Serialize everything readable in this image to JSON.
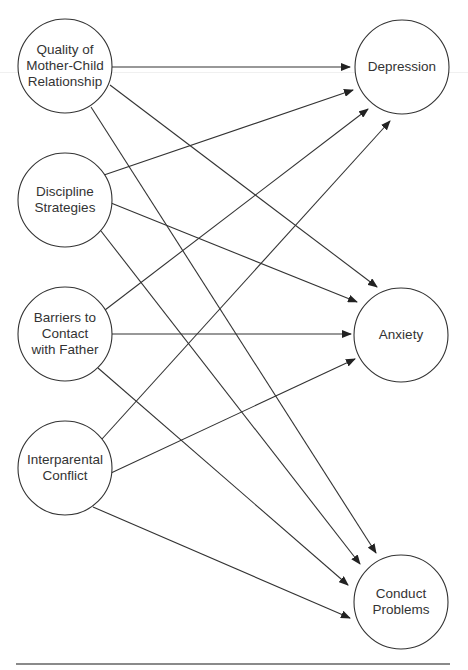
{
  "diagram": {
    "type": "path-model",
    "stroke_color": "#333333",
    "predictors": [
      {
        "id": "mother_child",
        "lines": [
          "Quality of",
          "Mother-Child",
          "Relationship"
        ],
        "cx": 65,
        "cy": 66,
        "r": 47
      },
      {
        "id": "discipline",
        "lines": [
          "Discipline",
          "Strategies"
        ],
        "cx": 65,
        "cy": 200,
        "r": 47
      },
      {
        "id": "barriers",
        "lines": [
          "Barriers to",
          "Contact",
          "with Father"
        ],
        "cx": 65,
        "cy": 334,
        "r": 47
      },
      {
        "id": "interparental",
        "lines": [
          "Interparental",
          "Conflict"
        ],
        "cx": 65,
        "cy": 468,
        "r": 47
      }
    ],
    "outcomes": [
      {
        "id": "depression",
        "lines": [
          "Depression"
        ],
        "cx": 402,
        "cy": 67,
        "r": 47
      },
      {
        "id": "anxiety",
        "lines": [
          "Anxiety"
        ],
        "cx": 401,
        "cy": 335,
        "r": 47
      },
      {
        "id": "conduct",
        "lines": [
          "Conduct",
          "Problems"
        ],
        "cx": 401,
        "cy": 602,
        "r": 47
      }
    ],
    "paths": [
      {
        "from": "mother_child",
        "to": "depression",
        "x1": 112,
        "y1": 67,
        "x2": 350,
        "y2": 67
      },
      {
        "from": "mother_child",
        "to": "anxiety",
        "x1": 110,
        "y1": 85,
        "x2": 377,
        "y2": 287
      },
      {
        "from": "mother_child",
        "to": "conduct",
        "x1": 91,
        "y1": 107,
        "x2": 376,
        "y2": 553
      },
      {
        "from": "discipline",
        "to": "depression",
        "x1": 104,
        "y1": 175,
        "x2": 353,
        "y2": 90
      },
      {
        "from": "discipline",
        "to": "anxiety",
        "x1": 111,
        "y1": 203,
        "x2": 357,
        "y2": 302
      },
      {
        "from": "discipline",
        "to": "conduct",
        "x1": 101,
        "y1": 231,
        "x2": 360,
        "y2": 564
      },
      {
        "from": "barriers",
        "to": "depression",
        "x1": 105,
        "y1": 310,
        "x2": 368,
        "y2": 109
      },
      {
        "from": "barriers",
        "to": "anxiety",
        "x1": 111,
        "y1": 334,
        "x2": 351,
        "y2": 334
      },
      {
        "from": "barriers",
        "to": "conduct",
        "x1": 98,
        "y1": 368,
        "x2": 348,
        "y2": 585
      },
      {
        "from": "interparental",
        "to": "depression",
        "x1": 102,
        "y1": 439,
        "x2": 390,
        "y2": 121
      },
      {
        "from": "interparental",
        "to": "anxiety",
        "x1": 111,
        "y1": 473,
        "x2": 355,
        "y2": 359
      },
      {
        "from": "interparental",
        "to": "conduct",
        "x1": 93,
        "y1": 507,
        "x2": 350,
        "y2": 618
      }
    ]
  }
}
